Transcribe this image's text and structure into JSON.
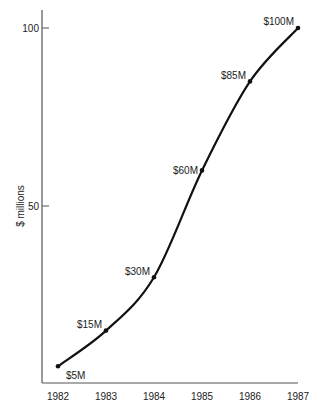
{
  "chart_data": {
    "type": "line",
    "title": "",
    "xlabel": "",
    "ylabel": "$ millions",
    "x": [
      "1982",
      "1983",
      "1984",
      "1985",
      "1986",
      "1987"
    ],
    "series": [
      {
        "name": "Revenue",
        "values": [
          5,
          15,
          30,
          60,
          85,
          100
        ],
        "point_labels": [
          "$5M",
          "$15M",
          "$30M",
          "$60M",
          "$85M",
          "$100M"
        ]
      }
    ],
    "ylim": [
      0,
      100
    ],
    "y_ticks": [
      50,
      100
    ],
    "y_tick_labels": [
      "50",
      "100"
    ],
    "grid": false,
    "legend": false,
    "curve_style": "smooth S-curve"
  },
  "colors": {
    "line": "#111111",
    "axis": "#555555",
    "text": "#222222",
    "background": "#ffffff"
  }
}
